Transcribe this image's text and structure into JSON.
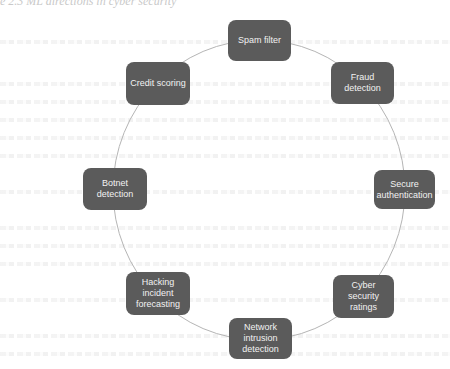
{
  "page": {
    "caption": "e 2.3 ML directions in cyber security"
  },
  "diagram": {
    "type": "cycle",
    "nodes": [
      {
        "id": "spam-filter",
        "label": "Spam filter",
        "x": 228,
        "y": 20,
        "w": 63,
        "h": 41
      },
      {
        "id": "fraud-detection",
        "label": "Fraud detection",
        "x": 331,
        "y": 62,
        "w": 63,
        "h": 42
      },
      {
        "id": "secure-authentication",
        "label": "Secure authentication",
        "x": 374,
        "y": 170,
        "w": 61,
        "h": 39
      },
      {
        "id": "cyber-security-ratings",
        "label": "Cyber security ratings",
        "x": 333,
        "y": 275,
        "w": 61,
        "h": 43
      },
      {
        "id": "network-intrusion-detection",
        "label": "Network intrusion detection",
        "x": 229,
        "y": 318,
        "w": 63,
        "h": 41
      },
      {
        "id": "hacking-incident-forecasting",
        "label": "Hacking incident forecasting",
        "x": 126,
        "y": 272,
        "w": 64,
        "h": 43
      },
      {
        "id": "botnet-detection",
        "label": "Botnet detection",
        "x": 83,
        "y": 168,
        "w": 64,
        "h": 42
      },
      {
        "id": "credit-scoring",
        "label": "Credit scoring",
        "x": 126,
        "y": 62,
        "w": 64,
        "h": 43
      }
    ],
    "colors": {
      "node_fill": "#5b5b5b",
      "node_text": "#f2f2f2",
      "connector": "#b5b5b5"
    }
  }
}
